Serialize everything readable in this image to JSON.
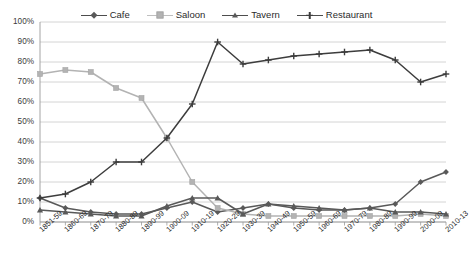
{
  "chart_data": {
    "type": "line",
    "title": "",
    "subtitle": "",
    "xlabel": "",
    "ylabel": "",
    "ylim": [
      0,
      100
    ],
    "y_tick_labels": [
      "100%",
      "90%",
      "80%",
      "70%",
      "60%",
      "50%",
      "40%",
      "30%",
      "20%",
      "10%",
      "0%"
    ],
    "y_tick_values": [
      100,
      90,
      80,
      70,
      60,
      50,
      40,
      30,
      20,
      10,
      0
    ],
    "grid": true,
    "legend_position": "top-center",
    "categories": [
      "1851-59",
      "1860-69",
      "1870-79",
      "1880-89",
      "1890-99",
      "1900-09",
      "1910-19",
      "1920-29",
      "1930-39",
      "1940-49",
      "1950-59",
      "1960-69",
      "1970-79",
      "1980-89",
      "1990-99",
      "2000-09",
      "2010-13"
    ],
    "series": [
      {
        "name": "Cafe",
        "marker": "diamond",
        "color": "#595959",
        "values": [
          12,
          7,
          5,
          4,
          4,
          7,
          10,
          5,
          7,
          9,
          7,
          6,
          6,
          7,
          9,
          20,
          25
        ]
      },
      {
        "name": "Saloon",
        "marker": "square",
        "color": "#b3b3b3",
        "values": [
          74,
          76,
          75,
          67,
          62,
          42,
          20,
          7,
          4,
          3,
          3,
          3,
          3,
          3,
          3,
          4,
          3
        ]
      },
      {
        "name": "Tavern",
        "marker": "triangle",
        "color": "#595959",
        "values": [
          6,
          5,
          4,
          3,
          3,
          8,
          12,
          12,
          4,
          9,
          8,
          7,
          6,
          7,
          5,
          5,
          4
        ]
      },
      {
        "name": "Restaurant",
        "marker": "cross",
        "color": "#3d3d3d",
        "values": [
          12,
          14,
          20,
          30,
          30,
          42,
          59,
          90,
          79,
          81,
          83,
          84,
          85,
          86,
          81,
          70,
          74
        ]
      }
    ]
  },
  "legend": {
    "items": [
      {
        "label": "Cafe",
        "marker": "diamond"
      },
      {
        "label": "Saloon",
        "marker": "square"
      },
      {
        "label": "Tavern",
        "marker": "triangle"
      },
      {
        "label": "Restaurant",
        "marker": "cross"
      }
    ]
  }
}
